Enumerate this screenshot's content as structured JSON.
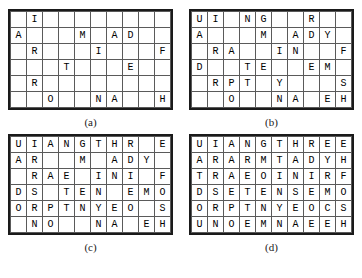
{
  "figure": {
    "panels": [
      {
        "caption": "(a)",
        "name": "grid-a",
        "rows": 6,
        "cols": 10,
        "cells": [
          [
            "",
            "I",
            "",
            "",
            "",
            "",
            "",
            "",
            "",
            ""
          ],
          [
            "A",
            "",
            "",
            "",
            "M",
            "",
            "A",
            "D",
            "",
            ""
          ],
          [
            "",
            "R",
            "",
            "",
            "",
            "I",
            "",
            "",
            "",
            "F"
          ],
          [
            "",
            "",
            "",
            "T",
            "",
            "",
            "",
            "E",
            "",
            ""
          ],
          [
            "",
            "R",
            "",
            "",
            "",
            "",
            "",
            "",
            "",
            ""
          ],
          [
            "",
            "",
            "O",
            "",
            "",
            "N",
            "A",
            "",
            "",
            "H"
          ]
        ]
      },
      {
        "caption": "(b)",
        "name": "grid-b",
        "rows": 6,
        "cols": 10,
        "cells": [
          [
            "U",
            "I",
            "",
            "N",
            "G",
            "",
            "",
            "R",
            "",
            ""
          ],
          [
            "A",
            "",
            "",
            "",
            "M",
            "",
            "A",
            "D",
            "Y",
            ""
          ],
          [
            "",
            "R",
            "A",
            "",
            "",
            "I",
            "N",
            "",
            "",
            "F"
          ],
          [
            "D",
            "",
            "",
            "T",
            "E",
            "",
            "",
            "E",
            "M",
            ""
          ],
          [
            "",
            "R",
            "P",
            "T",
            "",
            "Y",
            "",
            "",
            "",
            "S"
          ],
          [
            "",
            "",
            "O",
            "",
            "",
            "N",
            "A",
            "",
            "E",
            "H"
          ]
        ]
      },
      {
        "caption": "(c)",
        "name": "grid-c",
        "rows": 6,
        "cols": 10,
        "cells": [
          [
            "U",
            "I",
            "A",
            "N",
            "G",
            "T",
            "H",
            "R",
            "",
            "E"
          ],
          [
            "A",
            "R",
            "",
            "",
            "M",
            "",
            "A",
            "D",
            "Y",
            ""
          ],
          [
            "",
            "R",
            "A",
            "E",
            "",
            "I",
            "N",
            "I",
            "",
            "F"
          ],
          [
            "D",
            "S",
            "",
            "T",
            "E",
            "N",
            "",
            "E",
            "M",
            "O"
          ],
          [
            "O",
            "R",
            "P",
            "T",
            "N",
            "Y",
            "E",
            "O",
            "",
            "S"
          ],
          [
            "",
            "N",
            "O",
            "",
            "",
            "N",
            "A",
            "",
            "E",
            "H"
          ]
        ]
      },
      {
        "caption": "(d)",
        "name": "grid-d",
        "rows": 6,
        "cols": 10,
        "cells": [
          [
            "U",
            "I",
            "A",
            "N",
            "G",
            "T",
            "H",
            "R",
            "E",
            "E"
          ],
          [
            "A",
            "R",
            "A",
            "R",
            "M",
            "T",
            "A",
            "D",
            "Y",
            "H"
          ],
          [
            "T",
            "R",
            "A",
            "E",
            "O",
            "I",
            "N",
            "I",
            "R",
            "F"
          ],
          [
            "D",
            "S",
            "E",
            "T",
            "E",
            "N",
            "S",
            "E",
            "M",
            "O"
          ],
          [
            "O",
            "R",
            "P",
            "T",
            "N",
            "Y",
            "E",
            "O",
            "C",
            "S"
          ],
          [
            "U",
            "N",
            "O",
            "E",
            "M",
            "N",
            "A",
            "E",
            "E",
            "H"
          ]
        ]
      }
    ],
    "colors": {
      "border": "#1a1a1a",
      "cell_line": "#5a5a5a",
      "text": "#000000",
      "background": "#ffffff"
    }
  }
}
